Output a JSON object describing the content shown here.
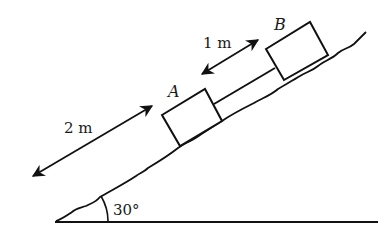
{
  "diagram": {
    "type": "inclined-plane",
    "incline_angle_label": "30°",
    "blocks": [
      {
        "id": "A",
        "label": "A"
      },
      {
        "id": "B",
        "label": "B"
      }
    ],
    "dimensions": [
      {
        "id": "distance-A-to-bottom",
        "label": "2 m"
      },
      {
        "id": "distance-A-to-B",
        "label": "1 m"
      }
    ],
    "colors": {
      "stroke": "#111111",
      "background": "#ffffff"
    }
  }
}
